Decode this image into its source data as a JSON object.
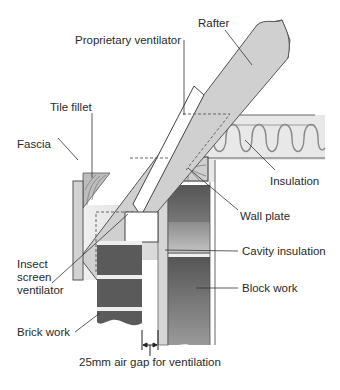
{
  "diagram": {
    "labels": {
      "rafter": "Rafter",
      "proprietary_ventilator": "Proprietary ventilator",
      "tile_fillet": "Tile fillet",
      "fascia": "Fascia",
      "insulation": "Insulation",
      "wall_plate": "Wall plate",
      "insect_screen_ventilator": "Insect\nscreen\nventilator",
      "cavity_insulation": "Cavity insulation",
      "block_work": "Block work",
      "brick_work": "Brick work",
      "air_gap": "25mm air gap for ventilation"
    },
    "colors": {
      "timber": "#d2d2d2",
      "timber_light": "#e6e6e6",
      "brick": "#5a5a5a",
      "block": "#6e6e6e",
      "insulation": "#efefef",
      "outline": "#555555"
    }
  }
}
